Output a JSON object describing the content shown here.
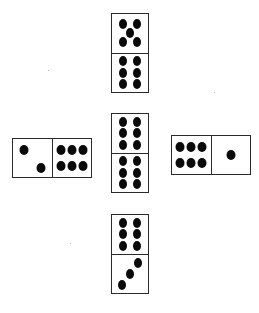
{
  "dominoes": [
    {
      "id": "top",
      "orientation": "vertical",
      "ends": [
        5,
        6
      ]
    },
    {
      "id": "left",
      "orientation": "horizontal",
      "ends": [
        2,
        6
      ]
    },
    {
      "id": "center",
      "orientation": "vertical",
      "ends": [
        6,
        6
      ]
    },
    {
      "id": "right",
      "orientation": "horizontal",
      "ends": [
        6,
        1
      ]
    },
    {
      "id": "bottom",
      "orientation": "vertical",
      "ends": [
        6,
        3
      ]
    }
  ]
}
